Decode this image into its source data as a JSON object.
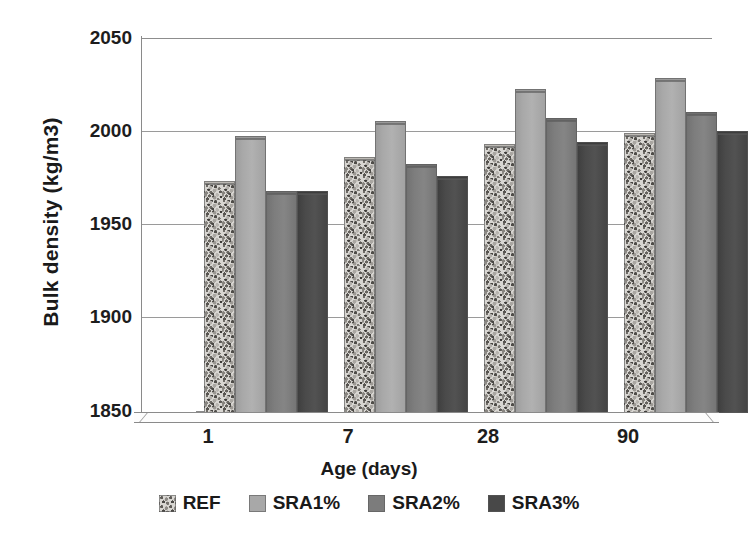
{
  "chart_data": {
    "type": "bar",
    "title": "",
    "subtitle": "",
    "xlabel": "Age (days)",
    "ylabel": "Bulk density (kg/m3)",
    "categories": [
      "1",
      "7",
      "28",
      "90"
    ],
    "ylim": [
      1850,
      2050
    ],
    "yticks": [
      1850,
      1900,
      1950,
      2000,
      2050
    ],
    "ytick_labels": [
      "1850",
      "1900",
      "1950",
      "2000",
      "2050"
    ],
    "grid": true,
    "legend_position": "bottom",
    "series": [
      {
        "name": "REF",
        "color": "#d8d6d2",
        "pattern": "speckled",
        "values": [
          1972,
          1985,
          1992,
          1998
        ]
      },
      {
        "name": "SRA1%",
        "color": "#a8a8a8",
        "pattern": "solid",
        "values": [
          1996,
          2004,
          2021,
          2027
        ]
      },
      {
        "name": "SRA2%",
        "color": "#7c7c7c",
        "pattern": "solid",
        "values": [
          1967,
          1981,
          2006,
          2009
        ]
      },
      {
        "name": "SRA3%",
        "color": "#484848",
        "pattern": "solid",
        "values": [
          1967,
          1975,
          1993,
          1999
        ]
      }
    ]
  },
  "axes": {
    "y_title": "Bulk density (kg/m3)",
    "x_title": "Age (days)",
    "y_tick_0": "1850",
    "y_tick_1": "1900",
    "y_tick_2": "1950",
    "y_tick_3": "2000",
    "y_tick_4": "2050",
    "x_tick_0": "1",
    "x_tick_1": "7",
    "x_tick_2": "28",
    "x_tick_3": "90"
  },
  "legend": {
    "items": [
      {
        "label": "REF",
        "swatch": "ref"
      },
      {
        "label": "SRA1%",
        "swatch": "sra1"
      },
      {
        "label": "SRA2%",
        "swatch": "sra2"
      },
      {
        "label": "SRA3%",
        "swatch": "sra3"
      }
    ]
  }
}
